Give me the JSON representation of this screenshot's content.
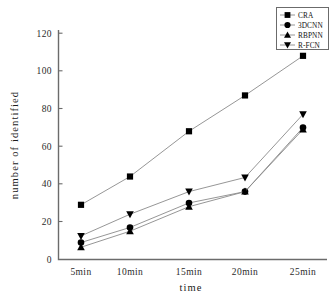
{
  "chart_data": {
    "type": "line",
    "title": "",
    "xlabel": "time",
    "ylabel": "number of identified",
    "categories": [
      "5min",
      "10min",
      "15min",
      "20min",
      "25min"
    ],
    "yticks": [
      0,
      20,
      40,
      60,
      80,
      100,
      120
    ],
    "ylim": [
      0,
      120
    ],
    "grid": false,
    "legend_position": "top-right",
    "series": [
      {
        "name": "CRA",
        "marker": "square",
        "values": [
          29,
          44,
          68,
          87,
          108
        ]
      },
      {
        "name": "3DCNN",
        "marker": "circle",
        "values": [
          9,
          17,
          30,
          36,
          70
        ]
      },
      {
        "name": "RBPNN",
        "marker": "triangle-up",
        "values": [
          6.5,
          15,
          28,
          36,
          69
        ]
      },
      {
        "name": "R-FCN",
        "marker": "triangle-down",
        "values": [
          12.5,
          24,
          36,
          43.5,
          77
        ]
      }
    ],
    "colors": {
      "marker": "#000000",
      "line": "#8a8a8a",
      "axis": "#6b6b6b",
      "text": "#1a1a1a",
      "background": "#ffffff"
    }
  },
  "axis": {
    "y_labels": [
      "120",
      "100",
      "80",
      "60",
      "40",
      "20",
      "0"
    ],
    "x_labels": [
      "5min",
      "10min",
      "15min",
      "20min",
      "25min"
    ],
    "x_title": "time",
    "y_title": "number of identified"
  },
  "legend": {
    "entries": [
      {
        "label": "CRA"
      },
      {
        "label": "3DCNN"
      },
      {
        "label": "RBPNN"
      },
      {
        "label": "R-FCN"
      }
    ]
  }
}
